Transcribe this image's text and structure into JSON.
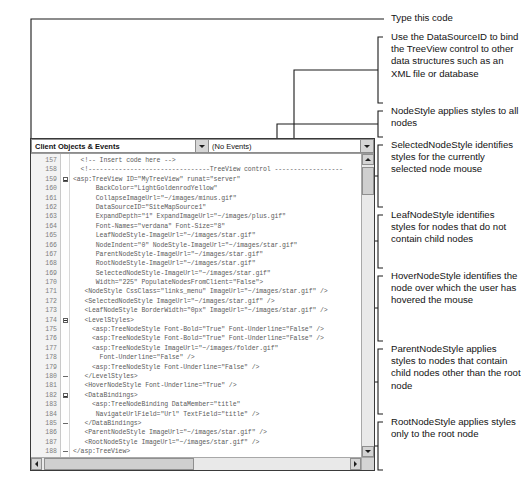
{
  "editor": {
    "name": "visual-studio-source-editor",
    "combo_objects": {
      "value": "Client Objects & Events",
      "icon": "chevron-down-icon"
    },
    "combo_events": {
      "value": "(No Events)",
      "icon": "chevron-down-icon"
    },
    "first_line_number": 157,
    "lines": [
      {
        "num": "157",
        "fold": "none",
        "text": "  <!-- Insert code here -->"
      },
      {
        "num": "158",
        "fold": "none",
        "text": "  <!--------------------------------TreeView control ------------------"
      },
      {
        "num": "159",
        "fold": "minus",
        "text": "<asp:TreeView ID=\"MyTreeView\" runat=\"server\""
      },
      {
        "num": "160",
        "fold": "none",
        "text": "      BackColor=\"LightGoldenrodYellow\""
      },
      {
        "num": "161",
        "fold": "none",
        "text": "      CollapseImageUrl=\"~/images/minus.gif\""
      },
      {
        "num": "162",
        "fold": "none",
        "text": "      DataSourceID=\"SiteMapSource1\""
      },
      {
        "num": "163",
        "fold": "none",
        "text": "      ExpandDepth=\"1\" ExpandImageUrl=\"~/images/plus.gif\""
      },
      {
        "num": "164",
        "fold": "none",
        "text": "      Font-Names=\"verdana\" Font-Size=\"8\""
      },
      {
        "num": "165",
        "fold": "none",
        "text": "      LeafNodeStyle-ImageUrl=\"~/images/star.gif\""
      },
      {
        "num": "166",
        "fold": "none",
        "text": "      NodeIndent=\"0\" NodeStyle-ImageUrl=\"~/images/star.gif\""
      },
      {
        "num": "167",
        "fold": "none",
        "text": "      ParentNodeStyle-ImageUrl=\"~/images/star.gif\""
      },
      {
        "num": "168",
        "fold": "none",
        "text": "      RootNodeStyle-ImageUrl=\"~/images/star.gif\""
      },
      {
        "num": "169",
        "fold": "none",
        "text": "      SelectedNodeStyle-ImageUrl=\"~/images/star.gif\""
      },
      {
        "num": "170",
        "fold": "none",
        "text": "      Width=\"225\" PopulateNodesFromClient=\"False\">"
      },
      {
        "num": "171",
        "fold": "none",
        "text": "   <NodeStyle CssClass=\"links_menu\" ImageUrl=\"~/images/star.gif\" />"
      },
      {
        "num": "172",
        "fold": "none",
        "text": "   <SelectedNodeStyle ImageUrl=\"~/images/star.gif\" />"
      },
      {
        "num": "173",
        "fold": "none",
        "text": "   <LeafNodeStyle BorderWidth=\"0px\" ImageUrl=\"~/images/star.gif\" />"
      },
      {
        "num": "174",
        "fold": "minus",
        "text": "   <LevelStyles>"
      },
      {
        "num": "175",
        "fold": "none",
        "text": "     <asp:TreeNodeStyle Font-Bold=\"True\" Font-Underline=\"False\" />"
      },
      {
        "num": "176",
        "fold": "none",
        "text": "     <asp:TreeNodeStyle Font-Bold=\"True\" Font-Underline=\"False\" />"
      },
      {
        "num": "177",
        "fold": "none",
        "text": "     <asp:TreeNodeStyle ImageUrl=\"~/images/folder.gif\""
      },
      {
        "num": "178",
        "fold": "none",
        "text": "       Font-Underline=\"False\" />"
      },
      {
        "num": "179",
        "fold": "none",
        "text": "     <asp:TreeNodeStyle Font-Underline=\"False\" />"
      },
      {
        "num": "180",
        "fold": "dash",
        "text": "   </LevelStyles>"
      },
      {
        "num": "181",
        "fold": "none",
        "text": "   <HoverNodeStyle Font-Underline=\"True\" />"
      },
      {
        "num": "182",
        "fold": "minus",
        "text": "   <DataBindings>"
      },
      {
        "num": "183",
        "fold": "none",
        "text": "     <asp:TreeNodeBinding DataMember=\"title\""
      },
      {
        "num": "184",
        "fold": "none",
        "text": "      NavigateUrlField=\"Url\" TextField=\"title\" />"
      },
      {
        "num": "185",
        "fold": "dash",
        "text": "   </DataBindings>"
      },
      {
        "num": "186",
        "fold": "none",
        "text": "   <ParentNodeStyle ImageUrl=\"~/images/star.gif\" />"
      },
      {
        "num": "187",
        "fold": "none",
        "text": "   <RootNodeStyle ImageUrl=\"~/images/star.gif\" />"
      },
      {
        "num": "188",
        "fold": "dash",
        "text": "</asp:TreeView>"
      },
      {
        "num": "189",
        "fold": "none",
        "text": ""
      }
    ],
    "scroll_vertical": {
      "name": "vertical-scrollbar",
      "up_icon": "caret-up-icon",
      "down_icon": "caret-down-icon"
    },
    "scroll_horizontal": {
      "name": "horizontal-scrollbar",
      "left_icon": "caret-left-icon",
      "right_icon": "caret-right-icon"
    }
  },
  "annotations": [
    {
      "id": "type-this-code",
      "text": "Type this code"
    },
    {
      "id": "datasourceid",
      "text": "Use the DataSourceID to bind the TreeView control to other data structures such as an XML file or database"
    },
    {
      "id": "nodestyle",
      "text": "NodeStyle applies styles to all nodes"
    },
    {
      "id": "selectednodestyle",
      "text": "SelectedNodeStyle identifies styles for the currently selected node mouse"
    },
    {
      "id": "leafnodestyle",
      "text": "LeafNodeStyle identifies styles for nodes that do not contain child nodes"
    },
    {
      "id": "hovernodestyle",
      "text": "HoverNodeStyle identifies the node over which the user has hovered the mouse"
    },
    {
      "id": "parentnodestyle",
      "text": "ParentNodeStyle applies styles to nodes that contain child nodes other than the root node"
    },
    {
      "id": "rootnodestyle",
      "text": "RootNodeStyle applies styles only to the root node"
    }
  ],
  "colors": {
    "page_background": "#ffffff",
    "annotation_text": "#131313",
    "code_text": "#5b5b5b",
    "line_number": "#7d7d7d",
    "window_border": "#3a3a3a",
    "leader_line": "#1a1a1a"
  }
}
